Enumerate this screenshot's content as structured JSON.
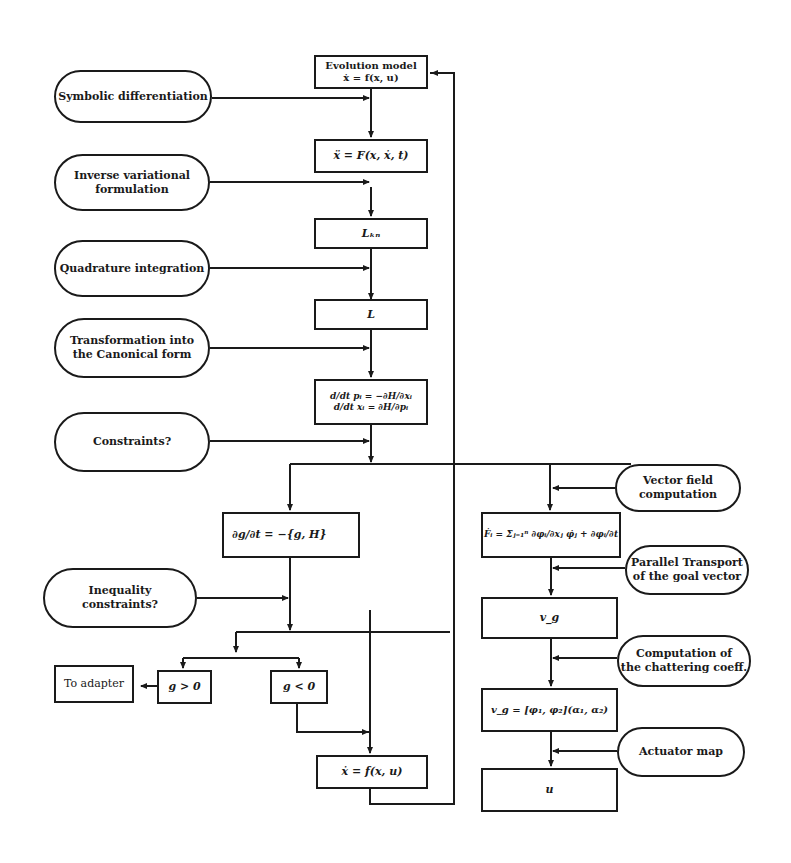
{
  "diagram": {
    "type": "flowchart",
    "process_nodes": {
      "evolution_model": "Evolution model\nẋ = f(x, u)",
      "second_order": "ẍ = F(x, ẋ, t)",
      "lagrangian_kn": "Lₖₙ",
      "lagrangian": "L",
      "hamilton_eqs": "d/dt pᵢ = −∂H/∂xᵢ\nd/dt xᵢ = ∂H/∂pᵢ",
      "constraint_poisson": "∂g/∂t = −{g, H}",
      "to_adapter": "To adapter",
      "g_positive": "g > 0",
      "g_negative": "g < 0",
      "state_eq": "ẋ = f(x, u)",
      "vector_field_eq": "Ḟᵢ = Σⱼ₌₁ⁿ ∂φᵢ/∂xⱼ φ̇ⱼ + ∂φᵢ/∂t",
      "goal_vector": "v_g",
      "chattering_eq": "v_g = [φ₁, φ₂](α₁, α₂)",
      "control_u": "u"
    },
    "operation_nodes": {
      "symbolic_diff": "Symbolic differentiation",
      "inverse_variational": "Inverse variational\nformulation",
      "quadrature": "Quadrature integration",
      "canonical": "Transformation into\nthe Canonical form",
      "constraints": "Constraints?",
      "inequality": "Inequality\nconstraints?",
      "vector_field": "Vector field\ncomputation",
      "parallel_transport": "Parallel Transport\nof the goal vector",
      "chattering": "Computation of\nthe chattering coeff.",
      "actuator": "Actuator map"
    }
  }
}
